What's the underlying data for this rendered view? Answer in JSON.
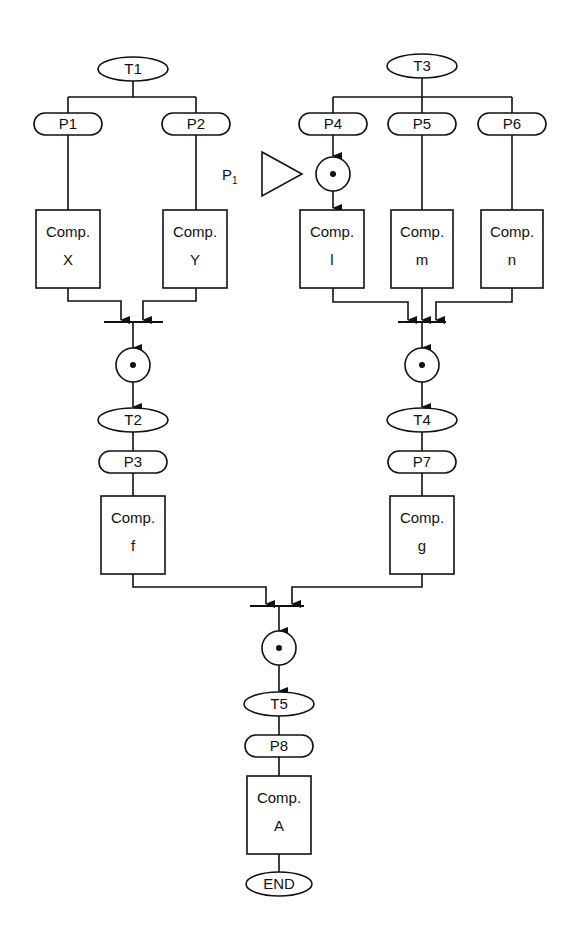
{
  "diagram": {
    "type": "petri-net-flow",
    "transitions": [
      {
        "id": "T1",
        "label": "T1",
        "x": 133,
        "y": 69
      },
      {
        "id": "T2",
        "label": "T2",
        "x": 133,
        "y": 420
      },
      {
        "id": "T3",
        "label": "T3",
        "x": 422,
        "y": 66
      },
      {
        "id": "T4",
        "label": "T4",
        "x": 422,
        "y": 420
      },
      {
        "id": "T5",
        "label": "T5",
        "x": 279,
        "y": 704
      },
      {
        "id": "END",
        "label": "END",
        "x": 279,
        "y": 884
      }
    ],
    "places": [
      {
        "id": "P1",
        "label": "P1",
        "x": 68,
        "y": 124
      },
      {
        "id": "P2",
        "label": "P2",
        "x": 196,
        "y": 124
      },
      {
        "id": "P3",
        "label": "P3",
        "x": 133,
        "y": 462
      },
      {
        "id": "P4",
        "label": "P4",
        "x": 333,
        "y": 124
      },
      {
        "id": "P5",
        "label": "P5",
        "x": 422,
        "y": 124
      },
      {
        "id": "P6",
        "label": "P6",
        "x": 512,
        "y": 124
      },
      {
        "id": "P7",
        "label": "P7",
        "x": 422,
        "y": 462
      },
      {
        "id": "P8",
        "label": "P8",
        "x": 279,
        "y": 746
      }
    ],
    "components": [
      {
        "id": "X",
        "title": "Comp.",
        "name": "X",
        "x": 36,
        "y": 210,
        "w": 64,
        "h": 78
      },
      {
        "id": "Y",
        "title": "Comp.",
        "name": "Y",
        "x": 163,
        "y": 210,
        "w": 64,
        "h": 78
      },
      {
        "id": "l",
        "title": "Comp.",
        "name": "l",
        "x": 300,
        "y": 210,
        "w": 64,
        "h": 78
      },
      {
        "id": "m",
        "title": "Comp.",
        "name": "m",
        "x": 391,
        "y": 210,
        "w": 62,
        "h": 78
      },
      {
        "id": "n",
        "title": "Comp.",
        "name": "n",
        "x": 481,
        "y": 210,
        "w": 62,
        "h": 78
      },
      {
        "id": "f",
        "title": "Comp.",
        "name": "f",
        "x": 101,
        "y": 496,
        "w": 64,
        "h": 78
      },
      {
        "id": "g",
        "title": "Comp.",
        "name": "g",
        "x": 390,
        "y": 496,
        "w": 64,
        "h": 78
      },
      {
        "id": "A",
        "title": "Comp.",
        "name": "A",
        "x": 247,
        "y": 776,
        "w": 64,
        "h": 78
      }
    ],
    "tokens": [
      {
        "id": "token-p4",
        "x": 333,
        "y": 174
      },
      {
        "id": "token-join1",
        "x": 133,
        "y": 365
      },
      {
        "id": "token-join2",
        "x": 422,
        "y": 365
      },
      {
        "id": "token-join3",
        "x": 279,
        "y": 648
      }
    ],
    "sync_bars": [
      {
        "id": "bar-1",
        "x1": 104,
        "x2": 163,
        "y": 322
      },
      {
        "id": "bar-2",
        "x1": 398,
        "x2": 446,
        "y": 322
      },
      {
        "id": "bar-3",
        "x1": 250,
        "x2": 304,
        "y": 606
      }
    ],
    "priority_marker": {
      "label": "P",
      "subscript": "1",
      "x": 256,
      "y": 174
    }
  }
}
